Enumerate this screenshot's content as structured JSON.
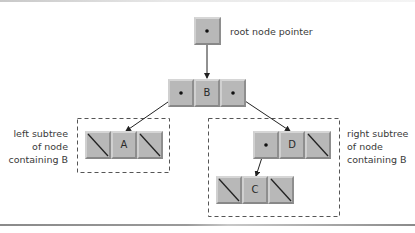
{
  "diagram": {
    "type": "binary-tree",
    "root_pointer_label": "root node pointer",
    "nodes": {
      "B": {
        "value": "B",
        "left": "A",
        "right": "D"
      },
      "A": {
        "value": "A",
        "left": null,
        "right": null
      },
      "D": {
        "value": "D",
        "left": "C",
        "right": null
      },
      "C": {
        "value": "C",
        "left": null,
        "right": null
      }
    },
    "left_subtree_label": [
      "left subtree",
      "of node",
      "containing B"
    ],
    "right_subtree_label": [
      "right subtree",
      "of node",
      "containing B"
    ]
  },
  "colors": {
    "cell_fill": "#b8b8b8",
    "line": "#222222",
    "dash": "#555555",
    "text": "#3a3a3a"
  }
}
